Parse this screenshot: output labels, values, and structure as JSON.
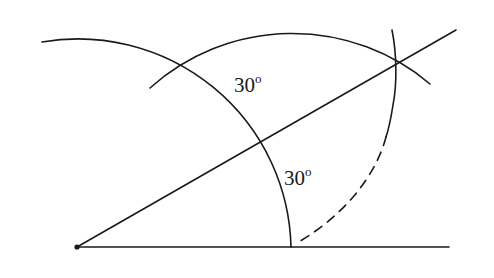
{
  "diagram": {
    "title": "",
    "colors": {
      "stroke": "#1a1a1a",
      "background": "#ffffff"
    },
    "labels": [
      {
        "id": "angle_upper",
        "text": "30",
        "degree": "o",
        "x": 234,
        "y": 92
      },
      {
        "id": "angle_lower",
        "text": "30",
        "degree": "o",
        "x": 284,
        "y": 185
      }
    ],
    "points": {
      "vertex": {
        "x": 77,
        "y": 247
      },
      "arc_baseline_intersection": {
        "x": 291,
        "y": 247
      },
      "arcs_crossing": {
        "x": 182,
        "y": 64
      },
      "bisector_arc_intersection": {
        "x": 396,
        "y": 64
      }
    },
    "lines": [
      {
        "id": "baseline",
        "from": [
          77,
          247
        ],
        "to": [
          449,
          247
        ]
      },
      {
        "id": "ray",
        "from": [
          77,
          247
        ],
        "to": [
          456,
          30
        ]
      }
    ]
  }
}
